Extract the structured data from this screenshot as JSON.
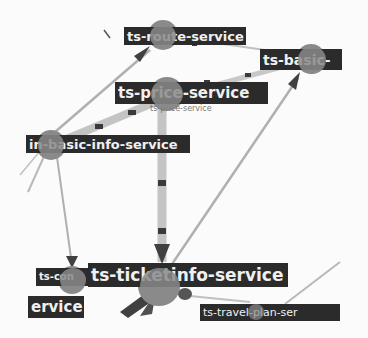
{
  "graph": {
    "title": "",
    "colors": {
      "background": "#fbfbfb",
      "node_fill": "#8a8a8a",
      "label_bg": "#2b2b2b",
      "label_text": "#f0f0f0",
      "edge": "#a8a8a8",
      "edge_heavy": "#c4c4c4",
      "arrow": "#404040",
      "traffic_dot": "#3a3a3a"
    },
    "nodes": [
      {
        "id": "n-top",
        "label": "ts-route-service"
      },
      {
        "id": "n-right",
        "label": "ts-basic-"
      },
      {
        "id": "n-mid",
        "label": "ts-price-service"
      },
      {
        "id": "n-mid-caption",
        "label": "ts-price-service"
      },
      {
        "id": "n-left",
        "label": "in-basic-info-service"
      },
      {
        "id": "n-bl",
        "label": "ts-con"
      },
      {
        "id": "n-bl2",
        "label": "ervice"
      },
      {
        "id": "n-ticket",
        "label": "ts-ticketinfo-service"
      },
      {
        "id": "n-travel",
        "label": "ts-travel-plan-ser"
      }
    ]
  }
}
